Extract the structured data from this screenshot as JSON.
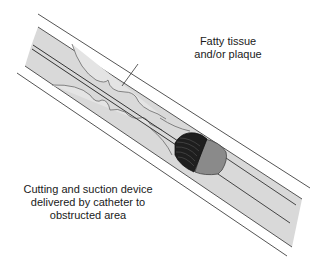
{
  "diagram": {
    "labels": {
      "plaque": {
        "line1": "Fatty tissue",
        "line2": "and/or plaque"
      },
      "device": {
        "line1": "Cutting and suction device",
        "line2": "delivered by catheter to",
        "line3": "obstructed area"
      }
    },
    "components": [
      {
        "id": "vessel-wall",
        "description": "Blood vessel walls (double outline)"
      },
      {
        "id": "vessel-lumen",
        "description": "Light grey lumen interior"
      },
      {
        "id": "plaque",
        "description": "Fatty tissue / plaque deposits with scalloped edges"
      },
      {
        "id": "guidewire",
        "description": "Catheter guide wire along center"
      },
      {
        "id": "cutter-head",
        "description": "Dark ribbed cutting head"
      },
      {
        "id": "device-body",
        "description": "Grey device body"
      },
      {
        "id": "catheter",
        "description": "Catheter shaft trailing to lower right"
      }
    ],
    "colors": {
      "lumen": "#d9d9d9",
      "wall_line": "#555555",
      "plaque_line": "#6a6a6a",
      "cutter": "#222222",
      "device_body": "#8a8a8a",
      "background": "#ffffff"
    }
  }
}
